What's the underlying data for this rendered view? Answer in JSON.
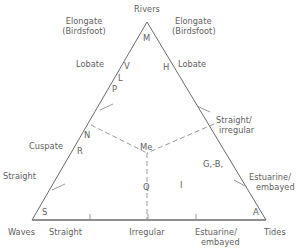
{
  "figure": {
    "type": "ternary-diagram",
    "apex_label": "Rivers",
    "bottom_left_label": "Waves",
    "bottom_right_label": "Tides",
    "line_color": "#6b6b6b",
    "text_color": "#5e5e5e",
    "background": "#ffffff"
  },
  "apex": {
    "rivers": "Rivers"
  },
  "upper_left": {
    "elongate_line1": "Elongate",
    "elongate_line2": "(Birdsfoot)",
    "lobate": "Lobate"
  },
  "upper_right": {
    "elongate_line1": "Elongate",
    "elongate_line2": "(Birdsfoot)",
    "lobate": "Lobate"
  },
  "left_side": {
    "cuspate": "Cuspate",
    "straight": "Straight"
  },
  "right_side": {
    "straight_irregular_line1": "Straight/",
    "straight_irregular_line2": "irregular",
    "estuarine_line1": "Estuarine/",
    "estuarine_line2": "embayed"
  },
  "bottom_axis": {
    "waves": "Waves",
    "straight": "Straight",
    "irregular": "Irregular",
    "estuarine_line1": "Estuarine/",
    "estuarine_line2": "embayed",
    "tides": "Tides"
  },
  "delta_codes": [
    {
      "id": "M",
      "label": "M",
      "x": 143,
      "y": 33
    },
    {
      "id": "V",
      "label": "V",
      "x": 124,
      "y": 61
    },
    {
      "id": "H",
      "label": "H",
      "x": 163,
      "y": 62
    },
    {
      "id": "L",
      "label": "L",
      "x": 118,
      "y": 73
    },
    {
      "id": "P",
      "label": "P",
      "x": 112,
      "y": 84
    },
    {
      "id": "N",
      "label": "N",
      "x": 84,
      "y": 130
    },
    {
      "id": "R",
      "label": "R",
      "x": 77,
      "y": 146
    },
    {
      "id": "Me",
      "label": "Me",
      "x": 140,
      "y": 142
    },
    {
      "id": "GB",
      "label": "G,-B,",
      "x": 203,
      "y": 159
    },
    {
      "id": "Q",
      "label": "Q",
      "x": 143,
      "y": 182
    },
    {
      "id": "I",
      "label": "I",
      "x": 180,
      "y": 180
    },
    {
      "id": "S",
      "label": "S",
      "x": 42,
      "y": 207
    },
    {
      "id": "A",
      "label": "A",
      "x": 253,
      "y": 207
    }
  ],
  "chart_data": {
    "type": "ternary",
    "title": "",
    "vertices": [
      {
        "name": "Rivers",
        "x": 147,
        "y": 22
      },
      {
        "name": "Waves",
        "x": 32,
        "y": 220
      },
      {
        "name": "Tides",
        "x": 266,
        "y": 220
      }
    ],
    "axis_ticks_bottom": [
      90,
      148,
      196
    ],
    "bottom_tick_labels": [
      "Straight",
      "Irregular",
      "Estuarine/embayed"
    ],
    "internal_divider": {
      "style": "dashed",
      "center": {
        "x": 147,
        "y": 153
      },
      "branch_left_end": {
        "x": 91,
        "y": 125
      },
      "branch_right_end": {
        "x": 214,
        "y": 124
      },
      "stem_end": {
        "x": 147,
        "y": 220
      }
    },
    "regions": [
      {
        "code": "M",
        "description": "Elongate (Birdsfoot) - river dominated"
      },
      {
        "code": "V",
        "description": "Lobate upper-left"
      },
      {
        "code": "H",
        "description": "Lobate upper-right"
      },
      {
        "code": "L",
        "description": "Lobate left margin"
      },
      {
        "code": "P",
        "description": "Lobate left margin lower"
      },
      {
        "code": "N",
        "description": "Cuspate left"
      },
      {
        "code": "R",
        "description": "Cuspate left lower"
      },
      {
        "code": "Me",
        "description": "Central mixed"
      },
      {
        "code": "G,-B,",
        "description": "Straight/irregular right"
      },
      {
        "code": "Q",
        "description": "Wave dominated lower centre"
      },
      {
        "code": "I",
        "description": "Tide influenced lower right"
      },
      {
        "code": "S",
        "description": "Straight - wave apex"
      },
      {
        "code": "A",
        "description": "Estuarine/embayed - tide apex"
      }
    ]
  }
}
